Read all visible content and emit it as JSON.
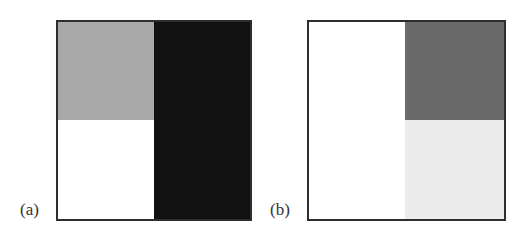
{
  "panels": [
    {
      "label": "(a)",
      "quadrants": {
        "top_left": "#a9a9a9",
        "bottom_left": "#ffffff",
        "right": "#111111"
      }
    },
    {
      "label": "(b)",
      "quadrants": {
        "left": "#ffffff",
        "top_right": "#6a6a6a",
        "bottom_right": "#ececec"
      }
    }
  ]
}
